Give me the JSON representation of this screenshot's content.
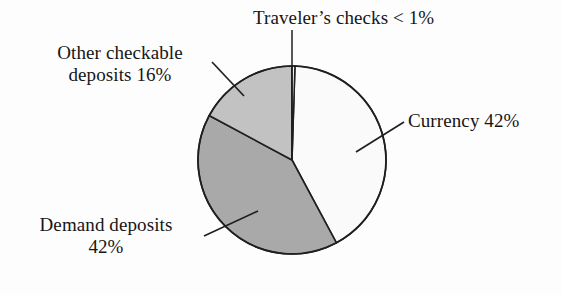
{
  "figure": {
    "kind": "pie-chart",
    "background_color": "#fdfdfd",
    "text_color": "#161616"
  },
  "labels": {
    "travelers": {
      "line1": "Traveler’s checks < 1%"
    },
    "other_checkable": {
      "line1": "Other checkable",
      "line2": "deposits 16%"
    },
    "currency": {
      "line1": "Currency 42%"
    },
    "demand": {
      "line1": "Demand deposits",
      "line2": "42%"
    }
  },
  "chart_data": {
    "type": "pie",
    "title": "",
    "subtitle": "",
    "xlabel": "",
    "ylabel": "",
    "legend_position": "none",
    "grid": false,
    "labels_placement": "external-callouts-with-leader-lines",
    "start_angle_deg": 90,
    "direction": "clockwise",
    "center": {
      "x": 292,
      "y": 160
    },
    "radius": 94,
    "outline_color": "#1f1f1f",
    "outline_width": 1.6,
    "categories": [
      "Currency",
      "Demand deposits",
      "Other checkable deposits",
      "Traveler’s checks"
    ],
    "values": [
      42,
      42,
      16,
      0.5
    ],
    "value_labels": [
      "42%",
      "42%",
      "16%",
      "< 1%"
    ],
    "slices": [
      {
        "name": "Traveler’s checks",
        "value": 0.5,
        "value_label": "< 1%",
        "display_text": "Traveler’s checks < 1%",
        "color": "#f7f7f7",
        "start_angle_deg": 88.2,
        "end_angle_deg": 90.0,
        "leader": {
          "x1": 292,
          "y1": 30,
          "x2": 292,
          "y2": 160
        }
      },
      {
        "name": "Currency",
        "value": 42,
        "value_label": "42%",
        "display_text": "Currency 42%",
        "color": "#fafafa",
        "start_angle_deg": -61.8,
        "end_angle_deg": 88.2,
        "leader": {
          "x1": 356,
          "y1": 152,
          "x2": 404,
          "y2": 122
        }
      },
      {
        "name": "Demand deposits",
        "value": 42,
        "value_label": "42%",
        "display_text": "Demand deposits 42%",
        "color": "#a9a9a9",
        "start_angle_deg": 151.8,
        "end_angle_deg": 298.2,
        "leader": {
          "x1": 258,
          "y1": 211,
          "x2": 204,
          "y2": 236
        }
      },
      {
        "name": "Other checkable deposits",
        "value": 16,
        "value_label": "16%",
        "display_text": "Other checkable deposits 16%",
        "color": "#c2c2c2",
        "start_angle_deg": 90.0,
        "end_angle_deg": 151.8,
        "leader": {
          "x1": 244,
          "y1": 96,
          "x2": 212,
          "y2": 62
        }
      }
    ]
  }
}
